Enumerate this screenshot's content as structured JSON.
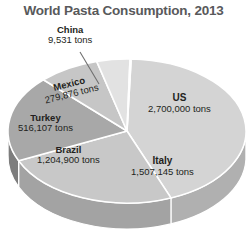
{
  "chart_data": {
    "type": "pie",
    "title": "World Pasta Consumption, 2013",
    "unit": "tons",
    "legend": "none",
    "labels_on_slices": true,
    "categories": [
      "US",
      "Italy",
      "Brazil",
      "Turkey",
      "Mexico",
      "China"
    ],
    "values": [
      2700000,
      1507145,
      1204900,
      516107,
      279876,
      9531
    ],
    "value_labels": [
      "2,700,000 tons",
      "1,507,145 tons",
      "1,204,900 tons",
      "516,107 tons",
      "279,876 tons",
      "9,531 tons"
    ],
    "slices": [
      {
        "name": "US",
        "value": 2700000,
        "value_label": "2,700,000 tons",
        "color": "#d4d4d4",
        "side_color": "#b0b0b0"
      },
      {
        "name": "Italy",
        "value": 1507145,
        "value_label": "1,507,145 tons",
        "color": "#c8c8c8",
        "side_color": "#a3a3a3"
      },
      {
        "name": "Brazil",
        "value": 1204900,
        "value_label": "1,204,900 tons",
        "color": "#a8a8a8",
        "side_color": "#7d7d7d"
      },
      {
        "name": "Turkey",
        "value": 516107,
        "value_label": "516,107 tons",
        "color": "#c6c6c6",
        "side_color": "#6a6a6a"
      },
      {
        "name": "Mexico",
        "value": 279876,
        "value_label": "279,876 tons",
        "color": "#e2e2e2",
        "side_color": "#9a9a9a"
      },
      {
        "name": "China",
        "value": 9531,
        "value_label": "9,531 tons",
        "color": "#5c5c5c",
        "side_color": "#4a4a4a"
      }
    ],
    "style": {
      "background": "#ffffff",
      "title_color": "#58595b",
      "label_color": "#231f20",
      "separator_color": "#ffffff",
      "leader_line_color": "#6e6e6e"
    }
  }
}
